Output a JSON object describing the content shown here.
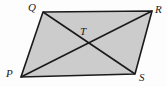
{
  "figure": {
    "name": "parallelogram-pqrs-with-diagonals",
    "background_color": "#fdfdfd",
    "fill_color": "#cccccc",
    "stroke_color": "#1a1a1a",
    "stroke_width": 1.6,
    "labels": {
      "q": "Q",
      "r": "R",
      "t": "T",
      "p": "P",
      "s": "S"
    },
    "vertices": {
      "Q": {
        "x": 43,
        "y": 12
      },
      "R": {
        "x": 152,
        "y": 11
      },
      "S": {
        "x": 135,
        "y": 74
      },
      "P": {
        "x": 21,
        "y": 77
      },
      "T": {
        "x": 85,
        "y": 44
      }
    },
    "polygon_points": "43,12 152,11 135,74 21,77",
    "diagonals": [
      {
        "name": "diagonal-PR",
        "from": "P",
        "to": "R"
      },
      {
        "name": "diagonal-QS",
        "from": "Q",
        "to": "S"
      }
    ],
    "edges": [
      {
        "name": "edge-QR",
        "from": "Q",
        "to": "R"
      },
      {
        "name": "edge-RS",
        "from": "R",
        "to": "S"
      },
      {
        "name": "edge-SP",
        "from": "S",
        "to": "P"
      },
      {
        "name": "edge-PQ",
        "from": "P",
        "to": "Q"
      }
    ]
  }
}
